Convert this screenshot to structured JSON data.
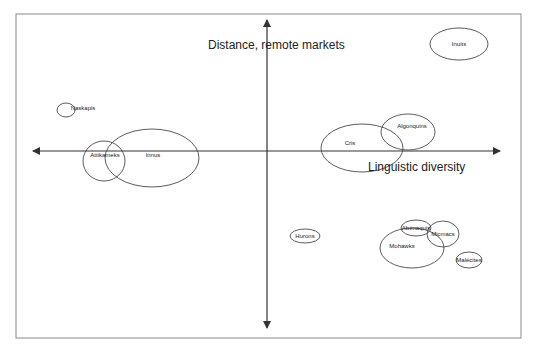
{
  "diagram": {
    "type": "positioning-map",
    "axes": {
      "vertical": {
        "label": "Distance, remote markets"
      },
      "horizontal": {
        "label": "Linguistic diversity"
      }
    },
    "groups": [
      {
        "name": "Inuits",
        "cx": 459,
        "cy": 44,
        "rx": 29,
        "ry": 16
      },
      {
        "name": "Naskapis",
        "cx": 66,
        "cy": 110,
        "rx": 9,
        "ry": 7
      },
      {
        "name": "Innus",
        "cx": 152,
        "cy": 158,
        "rx": 47,
        "ry": 29
      },
      {
        "name": "Attikameks",
        "cx": 104,
        "cy": 161,
        "rx": 21,
        "ry": 20
      },
      {
        "name": "Cris",
        "cx": 362,
        "cy": 148,
        "rx": 41,
        "ry": 24
      },
      {
        "name": "Algonquins",
        "cx": 408,
        "cy": 132,
        "rx": 27,
        "ry": 18
      },
      {
        "name": "Hurons",
        "cx": 305,
        "cy": 236,
        "rx": 15,
        "ry": 7
      },
      {
        "name": "Abénaquis",
        "cx": 416,
        "cy": 228,
        "rx": 15,
        "ry": 8
      },
      {
        "name": "Micmacs",
        "cx": 443,
        "cy": 234,
        "rx": 16,
        "ry": 13
      },
      {
        "name": "Mohawks",
        "cx": 412,
        "cy": 248,
        "rx": 32,
        "ry": 20
      },
      {
        "name": "Malécites",
        "cx": 469,
        "cy": 260,
        "rx": 13,
        "ry": 8
      }
    ]
  }
}
